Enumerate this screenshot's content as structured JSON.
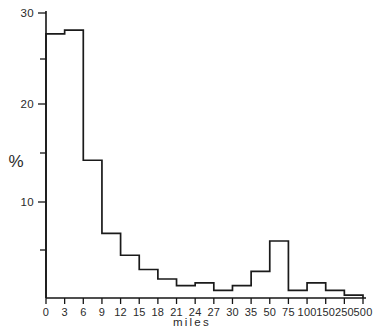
{
  "chart_data": {
    "type": "bar",
    "title": "",
    "subtitle": "",
    "xlabel": "miles",
    "ylabel": "%",
    "categories": [
      "0-3",
      "3-6",
      "6-9",
      "9-12",
      "12-15",
      "15-18",
      "18-21",
      "21-24",
      "24-27",
      "27-30",
      "30-35",
      "35-50",
      "50-75",
      "75-100",
      "100-150",
      "150-250",
      "250-500"
    ],
    "values": [
      27.8,
      28.2,
      14.5,
      6.8,
      4.5,
      3.0,
      2.0,
      1.3,
      1.6,
      0.8,
      1.3,
      2.8,
      6.0,
      0.8,
      1.6,
      0.8,
      0.3
    ],
    "bin_edges": [
      0,
      3,
      6,
      9,
      12,
      15,
      18,
      21,
      24,
      27,
      30,
      35,
      50,
      75,
      100,
      150,
      250,
      500
    ],
    "x_tick_labels": [
      "0",
      "3",
      "6",
      "9",
      "12",
      "15",
      "18",
      "21",
      "24",
      "27",
      "30",
      "35",
      "50",
      "75",
      "100",
      "150",
      "250",
      "500"
    ],
    "x_axis_scale": "categorical-equal-width",
    "y_tick_labels_major": [
      "30",
      "20",
      "10"
    ],
    "y_major_ticks": [
      30,
      20,
      10
    ],
    "y_minor_ticks": [
      25,
      15,
      5
    ],
    "ylim": [
      0,
      30.8
    ],
    "grid": false,
    "legend": null,
    "legend_position": "none",
    "series_count": 1,
    "line_color": "#1a1a1a",
    "background_color": "#ffffff"
  },
  "axes": {
    "y_label_text": "%",
    "x_label_text": "miles"
  }
}
